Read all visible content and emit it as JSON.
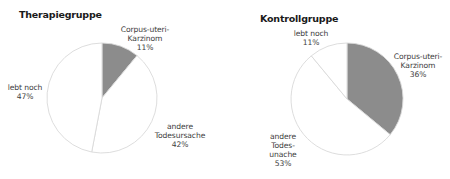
{
  "colors": {
    "tumor": "#8c8c8c",
    "other": "#ffffff",
    "outline": "#d9d9d9"
  },
  "charts": {
    "therapy": {
      "title": "Therapiegruppe",
      "labels": {
        "tumor": [
          "Corpus-uteri-",
          "Karzinom",
          "11%"
        ],
        "other": [
          "andere",
          "Todesursache",
          "42%"
        ],
        "alive": [
          "lebt noch",
          "47%"
        ]
      }
    },
    "control": {
      "title": "Kontrollgruppe",
      "labels": {
        "tumor": [
          "Corpus-uteri-",
          "Karzinom",
          "36%"
        ],
        "other": [
          "andere",
          "Todes-",
          "unache",
          "53%"
        ],
        "alive": [
          "lebt noch",
          "11%"
        ]
      }
    }
  },
  "chart_data": [
    {
      "type": "pie",
      "title": "Therapiegruppe",
      "categories": [
        "Corpus-uteri-Karzinom",
        "andere Todesursache",
        "lebt noch"
      ],
      "values": [
        11,
        42,
        47
      ],
      "unit": "%",
      "start_angle_deg": 0,
      "direction": "clockwise",
      "center": [
        102,
        98
      ],
      "radius": 55
    },
    {
      "type": "pie",
      "title": "Kontrollgruppe",
      "categories": [
        "Corpus-uteri-Karzinom",
        "andere Todesursache",
        "lebt noch"
      ],
      "values": [
        36,
        53,
        11
      ],
      "unit": "%",
      "start_angle_deg": 0,
      "direction": "clockwise",
      "center": [
        347,
        99
      ],
      "radius": 56
    }
  ]
}
